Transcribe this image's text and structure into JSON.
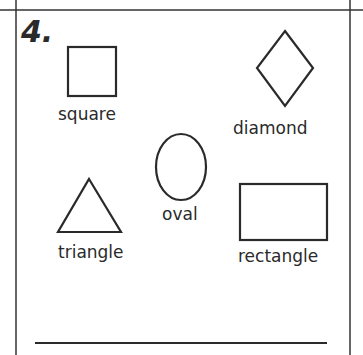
{
  "problem_number": "4.",
  "shapes": [
    {
      "name": "square",
      "label": "square"
    },
    {
      "name": "diamond",
      "label": "diamond"
    },
    {
      "name": "oval",
      "label": "oval"
    },
    {
      "name": "triangle",
      "label": "triangle"
    },
    {
      "name": "rectangle",
      "label": "rectangle"
    }
  ],
  "colors": {
    "stroke": "#2a2a2a",
    "background": "#ffffff"
  }
}
